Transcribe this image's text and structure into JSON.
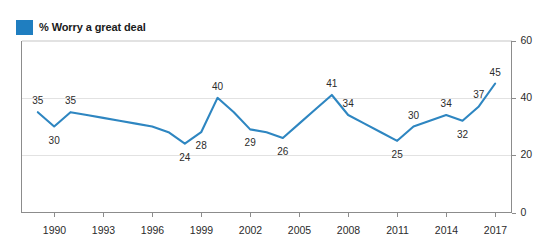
{
  "legend": {
    "label": "% Worry a great deal",
    "swatch_color": "#1f7ec0",
    "icon": "legend-square-icon"
  },
  "colors": {
    "line": "#2e86c1",
    "legend_swatch": "#1f7ec0",
    "gridline": "#e2e2e2",
    "axis": "#8c8c8c",
    "text": "#2b2b2b",
    "background": "#ffffff"
  },
  "chart_data": {
    "type": "line",
    "title": "",
    "subtitle": "",
    "xlabel": "",
    "ylabel": "",
    "legend_position": "top-left",
    "grid": true,
    "xlim": [
      1988,
      2018
    ],
    "ylim": [
      0,
      60
    ],
    "yticks": [
      0,
      20,
      40,
      60
    ],
    "ytick_labels": [
      "0",
      "20",
      "40",
      "60"
    ],
    "xticks": [
      1990,
      1993,
      1996,
      1999,
      2002,
      2005,
      2008,
      2011,
      2014,
      2017
    ],
    "xtick_labels": [
      "1990",
      "1993",
      "1996",
      "1999",
      "2002",
      "2005",
      "2008",
      "2011",
      "2014",
      "2017"
    ],
    "series": [
      {
        "name": "% Worry a great deal",
        "color": "#2e86c1",
        "x": [
          1989,
          1990,
          1991,
          1992,
          1993,
          1994,
          1995,
          1996,
          1997,
          1998,
          1999,
          2000,
          2001,
          2002,
          2003,
          2004,
          2005,
          2006,
          2007,
          2008,
          2009,
          2010,
          2011,
          2012,
          2013,
          2014,
          2015,
          2016,
          2017
        ],
        "values": [
          35,
          30,
          35,
          34,
          33,
          32,
          31,
          30,
          28,
          24,
          28,
          40,
          35,
          29,
          28,
          26,
          31,
          36,
          41,
          34,
          31,
          28,
          25,
          30,
          32,
          34,
          32,
          37,
          45
        ]
      }
    ],
    "point_labels": [
      {
        "x": 1989,
        "value": 35,
        "text": "35",
        "position": "above"
      },
      {
        "x": 1990,
        "value": 30,
        "text": "30",
        "position": "below"
      },
      {
        "x": 1991,
        "value": 35,
        "text": "35",
        "position": "above"
      },
      {
        "x": 1998,
        "value": 24,
        "text": "24",
        "position": "below"
      },
      {
        "x": 1999,
        "value": 28,
        "text": "28",
        "position": "below"
      },
      {
        "x": 2000,
        "value": 40,
        "text": "40",
        "position": "above"
      },
      {
        "x": 2002,
        "value": 29,
        "text": "29",
        "position": "below"
      },
      {
        "x": 2004,
        "value": 26,
        "text": "26",
        "position": "below"
      },
      {
        "x": 2007,
        "value": 41,
        "text": "41",
        "position": "above"
      },
      {
        "x": 2008,
        "value": 34,
        "text": "34",
        "position": "above"
      },
      {
        "x": 2011,
        "value": 25,
        "text": "25",
        "position": "below"
      },
      {
        "x": 2012,
        "value": 30,
        "text": "30",
        "position": "above"
      },
      {
        "x": 2014,
        "value": 34,
        "text": "34",
        "position": "above"
      },
      {
        "x": 2015,
        "value": 32,
        "text": "32",
        "position": "below"
      },
      {
        "x": 2016,
        "value": 37,
        "text": "37",
        "position": "above"
      },
      {
        "x": 2017,
        "value": 45,
        "text": "45",
        "position": "above"
      }
    ]
  }
}
